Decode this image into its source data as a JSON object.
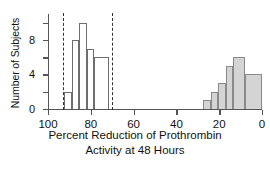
{
  "chart_data": {
    "type": "bar",
    "title": "",
    "subtitle": "",
    "xlabel_line1": "Percent Reduction of Prothrombin",
    "xlabel_line2": "Activity at 48 Hours",
    "ylabel": "Number of Subjects",
    "xlim": [
      100,
      0
    ],
    "x_reversed": true,
    "ylim": [
      0,
      11
    ],
    "grid": false,
    "legend": null,
    "x_ticks": [
      100,
      80,
      60,
      40,
      20,
      0
    ],
    "x_tick_labels": [
      "100",
      "80",
      "60",
      "40",
      "20",
      "0"
    ],
    "y_ticks": [
      0,
      2,
      4,
      6,
      8,
      10
    ],
    "y_tick_labels": [
      "0",
      "",
      "4",
      "",
      "8",
      ""
    ],
    "y_labeled_ticks": [
      0,
      4,
      8
    ],
    "bin_width": 3.5,
    "series": [
      {
        "name": "untreated-group",
        "fill": "none",
        "edge_color": "#6e6e6e",
        "bins": [
          {
            "x_start": 92.5,
            "x_end": 89.0,
            "value": 2
          },
          {
            "x_start": 89.0,
            "x_end": 85.5,
            "value": 8
          },
          {
            "x_start": 85.5,
            "x_end": 82.0,
            "value": 10
          },
          {
            "x_start": 82.0,
            "x_end": 78.5,
            "value": 7
          },
          {
            "x_start": 78.5,
            "x_end": 71.5,
            "value": 6
          }
        ]
      },
      {
        "name": "treated-group",
        "fill": "#d4d4d4",
        "edge_color": "#8a8a8a",
        "bins": [
          {
            "x_start": 27.5,
            "x_end": 24.0,
            "value": 1
          },
          {
            "x_start": 24.0,
            "x_end": 20.5,
            "value": 2
          },
          {
            "x_start": 20.5,
            "x_end": 17.0,
            "value": 3
          },
          {
            "x_start": 17.0,
            "x_end": 13.5,
            "value": 5
          },
          {
            "x_start": 13.5,
            "x_end": 8.0,
            "value": 6
          },
          {
            "x_start": 8.0,
            "x_end": 0.0,
            "value": 4
          }
        ]
      }
    ],
    "reference_lines": [
      {
        "name": "lower-reference-line",
        "x": 93.0,
        "style": "dashed",
        "color": "#333333"
      },
      {
        "name": "upper-reference-line",
        "x": 70.0,
        "style": "dashed",
        "color": "#333333"
      }
    ]
  },
  "colors": {
    "axis": "#555555",
    "bar_fill": "#d4d4d4",
    "bar_edge_filled": "#8a8a8a",
    "bar_edge_open": "#6e6e6e",
    "reference_line": "#333333",
    "text": "#111111",
    "background": "#ffffff"
  }
}
